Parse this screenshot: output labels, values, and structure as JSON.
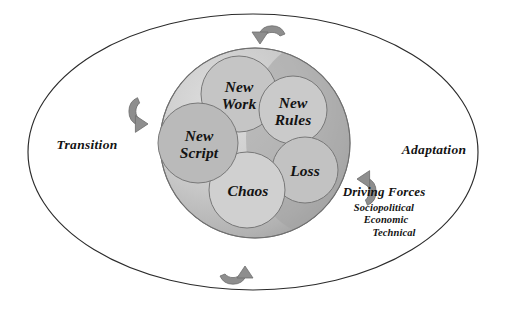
{
  "diagram": {
    "outer_ellipse": {
      "cx": 253,
      "cy": 152,
      "rx": 225,
      "ry": 138,
      "stroke": "#2b2b2b",
      "fill": "#ffffff"
    },
    "big_circle": {
      "cx": 255,
      "cy": 143,
      "r": 95,
      "fill_light": "#d9d9d9",
      "fill_mid": "#b8b8b8",
      "fill_dark": "#9a9a9a",
      "stroke": "#7d7d7d"
    },
    "inner_circles": [
      {
        "name": "new-work",
        "label": "New\nWork",
        "cx": 239,
        "cy": 94,
        "r": 38,
        "fill": "#c3c3c3",
        "stroke": "#7a7a7a"
      },
      {
        "name": "new-rules",
        "label": "New\nRules",
        "cx": 293,
        "cy": 110,
        "r": 34,
        "fill": "#c9c9c9",
        "stroke": "#7a7a7a"
      },
      {
        "name": "loss",
        "label": "Loss",
        "cx": 305,
        "cy": 170,
        "r": 33,
        "fill": "#c1c1c1",
        "stroke": "#7a7a7a"
      },
      {
        "name": "chaos",
        "label": "Chaos",
        "cx": 247,
        "cy": 190,
        "r": 38,
        "fill": "#cfcfcf",
        "stroke": "#7a7a7a"
      },
      {
        "name": "new-script",
        "label": "New\nScript",
        "cx": 198,
        "cy": 143,
        "r": 40,
        "fill": "#b9b9b9",
        "stroke": "#7a7a7a"
      }
    ],
    "side_labels": {
      "left": "Transition",
      "right": "Adaptation"
    },
    "driving_forces": {
      "title": "Driving Forces",
      "items": [
        "Sociopolitical",
        "Economic",
        "Technical"
      ]
    },
    "arrows": {
      "fill": "#8e8e8e",
      "stroke": "#6e6e6e",
      "names": [
        "arrow-top",
        "arrow-right",
        "arrow-bottom",
        "arrow-left"
      ]
    }
  }
}
